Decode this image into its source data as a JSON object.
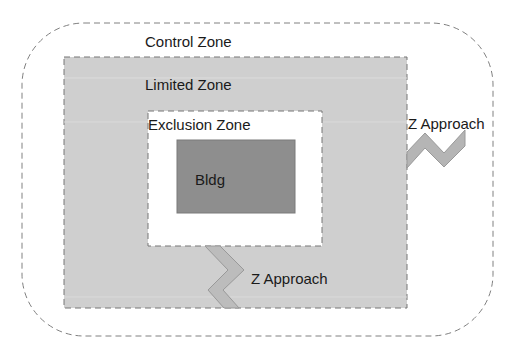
{
  "diagram": {
    "zones": {
      "control": {
        "label": "Control Zone"
      },
      "limited": {
        "label": "Limited Zone"
      },
      "exclusion": {
        "label": "Exclusion Zone"
      },
      "building": {
        "label": "Bldg"
      }
    },
    "approaches": [
      {
        "label": "Z Approach",
        "position": "right"
      },
      {
        "label": "Z Approach",
        "position": "bottom"
      }
    ],
    "colors": {
      "limited_fill": "#cfcfcf",
      "building_fill": "#8e8e8e",
      "approach_fill": "#b5b5b5",
      "border": "#777777"
    }
  }
}
